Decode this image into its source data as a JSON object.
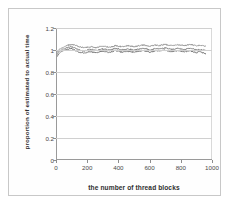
{
  "chart_data": {
    "type": "line",
    "title": "",
    "xlabel": "the number of thread blocks",
    "ylabel": "proportion of estimated to actual time",
    "xlim": [
      0,
      1000
    ],
    "ylim": [
      0,
      1.2
    ],
    "xticks": [
      "0",
      "200",
      "400",
      "600",
      "800",
      "1000"
    ],
    "xtick_values": [
      0,
      200,
      400,
      600,
      800,
      1000
    ],
    "yticks": [
      "0",
      "0.2",
      "0.4",
      "0.6",
      "0.8",
      "1",
      "1.2"
    ],
    "ytick_values": [
      0,
      0.2,
      0.4,
      0.6,
      0.8,
      1,
      1.2
    ],
    "grid": "horizontal",
    "legend": "none",
    "series_color": "#808080",
    "series": [
      {
        "name": "upper envelope",
        "color": "#8c8c8c",
        "x": [
          5,
          20,
          40,
          60,
          80,
          100,
          120,
          140,
          160,
          180,
          200,
          220,
          240,
          260,
          280,
          300,
          320,
          340,
          360,
          380,
          400,
          420,
          440,
          460,
          480,
          500,
          520,
          540,
          560,
          580,
          600,
          620,
          640,
          660,
          680,
          700,
          720,
          740,
          760,
          780,
          800,
          820,
          840,
          860,
          880,
          900,
          920,
          940,
          960
        ],
        "values": [
          0.975,
          1.005,
          1.02,
          1.035,
          1.045,
          1.05,
          1.045,
          1.035,
          1.025,
          1.02,
          1.025,
          1.03,
          1.025,
          1.02,
          1.03,
          1.035,
          1.03,
          1.025,
          1.03,
          1.04,
          1.035,
          1.03,
          1.035,
          1.04,
          1.035,
          1.03,
          1.035,
          1.04,
          1.045,
          1.04,
          1.035,
          1.04,
          1.045,
          1.04,
          1.045,
          1.05,
          1.045,
          1.04,
          1.045,
          1.05,
          1.045,
          1.04,
          1.045,
          1.05,
          1.045,
          1.04,
          1.045,
          1.04,
          1.035
        ]
      },
      {
        "name": "mid trace",
        "color": "#7a7a7a",
        "x": [
          5,
          20,
          40,
          60,
          80,
          100,
          120,
          140,
          160,
          180,
          200,
          220,
          240,
          260,
          280,
          300,
          320,
          340,
          360,
          380,
          400,
          420,
          440,
          460,
          480,
          500,
          520,
          540,
          560,
          580,
          600,
          620,
          640,
          660,
          680,
          700,
          720,
          740,
          760,
          780,
          800,
          820,
          840,
          860,
          880,
          900,
          920,
          940,
          960
        ],
        "values": [
          0.955,
          0.99,
          1.005,
          1.015,
          1.025,
          1.03,
          1.02,
          1.005,
          0.995,
          0.99,
          1.0,
          1.005,
          1.0,
          0.995,
          1.005,
          1.01,
          1.005,
          1.0,
          1.005,
          1.015,
          1.01,
          1.0,
          1.005,
          1.01,
          1.005,
          1.0,
          1.005,
          1.01,
          1.015,
          1.01,
          1.0,
          1.005,
          1.015,
          1.01,
          1.015,
          1.02,
          1.01,
          1.005,
          1.01,
          1.015,
          1.01,
          1.005,
          1.01,
          1.015,
          1.01,
          1.0,
          1.005,
          1.0,
          0.995
        ]
      },
      {
        "name": "lower envelope",
        "color": "#6e6e6e",
        "x": [
          5,
          20,
          40,
          60,
          80,
          100,
          120,
          140,
          160,
          180,
          200,
          220,
          240,
          260,
          280,
          300,
          320,
          340,
          360,
          380,
          400,
          420,
          440,
          460,
          480,
          500,
          520,
          540,
          560,
          580,
          600,
          620,
          640,
          660,
          680,
          700,
          720,
          740,
          760,
          780,
          800,
          820,
          840,
          860,
          880,
          900,
          920,
          940,
          960
        ],
        "values": [
          0.935,
          0.97,
          0.99,
          1.0,
          1.01,
          1.015,
          1.0,
          0.985,
          0.975,
          0.97,
          0.98,
          0.985,
          0.98,
          0.975,
          0.985,
          0.99,
          0.985,
          0.975,
          0.985,
          0.995,
          0.99,
          0.98,
          0.985,
          0.99,
          0.985,
          0.98,
          0.985,
          0.99,
          0.995,
          0.99,
          0.98,
          0.985,
          0.995,
          0.99,
          0.995,
          1.0,
          0.99,
          0.985,
          0.99,
          0.995,
          0.99,
          0.985,
          0.99,
          0.995,
          0.985,
          0.975,
          0.985,
          0.975,
          0.965
        ]
      }
    ]
  }
}
